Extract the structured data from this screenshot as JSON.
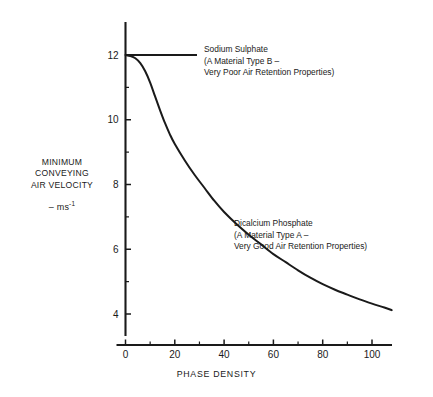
{
  "chart_data": {
    "type": "line",
    "title": "",
    "xlabel": "PHASE DENSITY",
    "ylabel": "MINIMUM CONVEYING AIR VELOCITY",
    "ylabel_units": "ms",
    "ylabel_units_exponent": "-1",
    "ylabel_units_prefix": "– ",
    "xlim": [
      0,
      108
    ],
    "ylim": [
      3.3,
      12.9
    ],
    "grid": false,
    "legend_position": "inline-annotations",
    "x_ticks_major": [
      0,
      20,
      40,
      60,
      80,
      100
    ],
    "x_ticks_major_labels": [
      "0",
      "20",
      "40",
      "60",
      "80",
      "100"
    ],
    "x_ticks_minor": [
      10,
      30,
      50,
      70,
      90
    ],
    "y_ticks_major": [
      4,
      6,
      8,
      10,
      12
    ],
    "y_ticks_major_labels": [
      "4",
      "6",
      "8",
      "10",
      "12"
    ],
    "y_ticks_minor": [
      5,
      7,
      9,
      11
    ],
    "series": [
      {
        "name": "Sodium Sulphate",
        "style": "horizontal-line",
        "x": [
          0,
          29
        ],
        "values": [
          12,
          12
        ]
      },
      {
        "name": "Dicalcium Phosphate",
        "style": "decaying-curve",
        "x": [
          0,
          2,
          4,
          6,
          8,
          10,
          12,
          14,
          16,
          18,
          20,
          24,
          28,
          32,
          36,
          40,
          45,
          50,
          55,
          60,
          65,
          70,
          75,
          80,
          85,
          90,
          95,
          100,
          105,
          108
        ],
        "values": [
          12.0,
          11.97,
          11.9,
          11.75,
          11.5,
          11.15,
          10.72,
          10.3,
          9.9,
          9.55,
          9.25,
          8.75,
          8.3,
          7.9,
          7.5,
          7.15,
          6.78,
          6.45,
          6.15,
          5.85,
          5.6,
          5.35,
          5.12,
          4.92,
          4.75,
          4.6,
          4.45,
          4.32,
          4.2,
          4.12
        ]
      }
    ]
  },
  "annotations": {
    "sodium": {
      "line1": "Sodium Sulphate",
      "line2": "(A Material Type B –",
      "line3": "Very Poor Air Retention Properties)"
    },
    "dicalcium": {
      "line1": "Dicalcium Phosphate",
      "line2": "(A Material Type A –",
      "line3": "Very Good Air Retention Properties)"
    }
  },
  "y_axis_title": {
    "line1": "MINIMUM",
    "line2": "CONVEYING",
    "line3": "AIR VELOCITY"
  },
  "colors": {
    "ink": "#1a1a1a",
    "background": "#ffffff"
  }
}
